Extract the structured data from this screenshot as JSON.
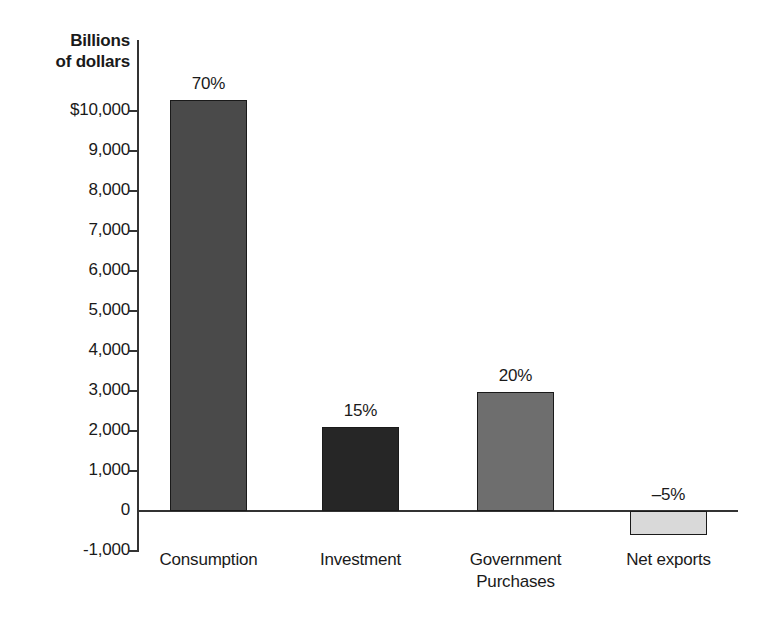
{
  "chart_data": {
    "type": "bar",
    "title": "",
    "subtitle": "",
    "xlabel": "",
    "ylabel": "Billions\nof dollars",
    "ylabel_lines": [
      "Billions",
      "of dollars"
    ],
    "categories": [
      "Consumption",
      "Investment",
      "Government Purchases",
      "Net exports"
    ],
    "category_label_lines": [
      [
        "Consumption"
      ],
      [
        "Investment"
      ],
      [
        "Government",
        "Purchases"
      ],
      [
        "Net exports"
      ]
    ],
    "values": [
      10275,
      2100,
      2975,
      -600
    ],
    "data_labels": [
      "70%",
      "15%",
      "20%",
      "–5%"
    ],
    "bar_colors": [
      "#4a4a4a",
      "#262626",
      "#6e6e6e",
      "#d9d9d9"
    ],
    "ylim": [
      -1000,
      10500
    ],
    "ytick_values": [
      10000,
      9000,
      8000,
      7000,
      6000,
      5000,
      4000,
      3000,
      2000,
      1000,
      0,
      -1000
    ],
    "ytick_labels": [
      "$10,000",
      "9,000",
      "8,000",
      "7,000",
      "6,000",
      "5,000",
      "4,000",
      "3,000",
      "2,000",
      "1,000",
      "0",
      "-1,000"
    ],
    "grid": false,
    "legend": false,
    "legend_position": "none",
    "axis_color": "#333333",
    "background_color": "#ffffff"
  }
}
